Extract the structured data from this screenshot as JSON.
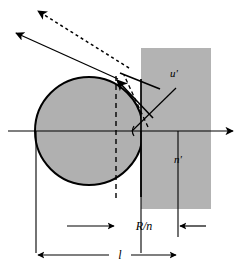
{
  "figure": {
    "title": "",
    "type": "optics-ray-diagram",
    "width": 243,
    "height": 273,
    "background_color": "#ffffff"
  },
  "colors": {
    "stroke": "#000000",
    "fill_gray": "#b0b0b0",
    "rect_gray": "#b3b3b3",
    "background": "#ffffff"
  },
  "labels": {
    "angle_u_prime": "u'",
    "index_n_prime": "n'",
    "dimension_r_over_n": "R/n",
    "dimension_l": "l"
  },
  "geometry": {
    "circle": {
      "center_x": 89,
      "center_y": 131,
      "radius": 54,
      "truncated_at_x": 141
    },
    "rectangle": {
      "x": 141,
      "y": 48,
      "width": 70,
      "height": 161
    },
    "optical_axis": {
      "y": 131,
      "x_start": 8,
      "x_end": 236
    },
    "vertex_point": {
      "x": 141,
      "y": 131
    },
    "surface_point": {
      "x": 116,
      "y": 79
    }
  },
  "elements": {
    "optical_axis_name": "optical-axis",
    "refracting_sphere_name": "refracting-sphere",
    "medium_block_name": "medium-block",
    "incident_ray_name": "incident-ray",
    "refracted_ray_name": "refracted-ray",
    "dashed_ray_name": "dashed-construction-ray",
    "dashed_vertical_name": "dashed-vertical-chord",
    "angle_arc_name": "angle-arc-u-prime",
    "leader_u_prime_name": "leader-line-u-prime"
  }
}
